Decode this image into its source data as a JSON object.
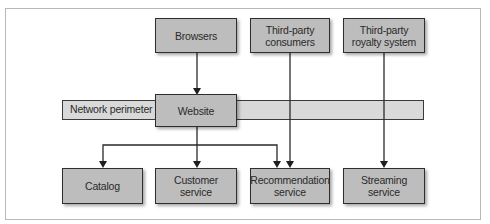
{
  "diagram": {
    "perimeter": {
      "label": "Network perimeter"
    },
    "nodes": {
      "browsers": "Browsers",
      "third_party_consumers": [
        "Third-party",
        "consumers"
      ],
      "third_party_royalty": [
        "Third-party",
        "royalty system"
      ],
      "website": "Website",
      "catalog": "Catalog",
      "customer_service": [
        "Customer",
        "service"
      ],
      "recommendation_service": [
        "Recommendation",
        "service"
      ],
      "streaming_service": [
        "Streaming",
        "service"
      ]
    },
    "edges": [
      {
        "from": "Browsers",
        "to": "Website"
      },
      {
        "from": "Website",
        "to": "Catalog"
      },
      {
        "from": "Website",
        "to": "Customer service"
      },
      {
        "from": "Website",
        "to": "Recommendation service"
      },
      {
        "from": "Third-party consumers",
        "to": "Recommendation service"
      },
      {
        "from": "Third-party royalty system",
        "to": "Streaming service"
      }
    ],
    "colors": {
      "box_fill": "#bdbdbd",
      "perimeter_fill": "#d9d9d9",
      "stroke": "#2e2e2e"
    }
  }
}
